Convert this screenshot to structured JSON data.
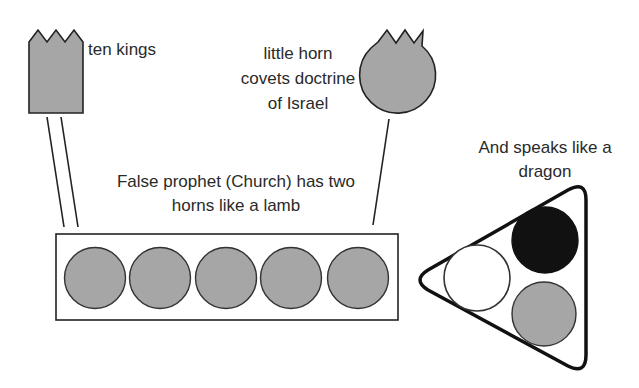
{
  "labels": {
    "ten_kings": "ten kings",
    "little_horn": [
      "little horn",
      "covets doctrine",
      "of Israel"
    ],
    "false_prophet": [
      "False prophet (Church) has two",
      "horns like a lamb"
    ],
    "dragon": [
      "And speaks like a",
      "dragon"
    ]
  },
  "colors": {
    "stroke": "#222222",
    "gray_fill": "#a6a6a6",
    "black_fill": "#111111",
    "white_fill": "#ffffff"
  },
  "shapes": {
    "ten_kings_crown": {
      "fill": "gray",
      "points": 3
    },
    "little_horn": {
      "fill": "gray",
      "points": 3
    },
    "lamb_horns_box": {
      "circles": 5,
      "circle_fill": "gray"
    },
    "dragon_triangle": {
      "circles": [
        {
          "position": "top-right",
          "fill": "black"
        },
        {
          "position": "left",
          "fill": "white"
        },
        {
          "position": "bottom-right",
          "fill": "gray"
        }
      ]
    }
  }
}
